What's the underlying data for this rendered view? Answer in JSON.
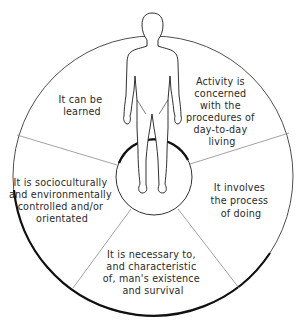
{
  "diagram": {
    "type": "wheel",
    "center_figure": "human-figure",
    "segments": [
      {
        "id": "learned",
        "lines": [
          "It can be",
          "learned"
        ]
      },
      {
        "id": "procedures",
        "lines": [
          "Activity is",
          "concerned",
          "with the",
          "procedures of",
          "day-to-day",
          "living"
        ]
      },
      {
        "id": "doing",
        "lines": [
          "It involves",
          "the process",
          "of doing"
        ]
      },
      {
        "id": "necessary",
        "lines": [
          "It is necessary to,",
          "and characteristic",
          "of, man's existence",
          "and survival"
        ]
      },
      {
        "id": "sociocultural",
        "lines": [
          "It is socioculturally",
          "and environmentally",
          "controlled and/or",
          "orientated"
        ]
      }
    ],
    "colors": {
      "stroke": "#1a1a1a",
      "divider": "#8a8a8a",
      "text": "#2a2a2a",
      "background": "#ffffff"
    }
  }
}
